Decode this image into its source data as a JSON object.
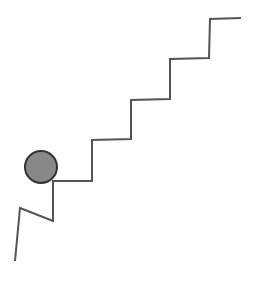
{
  "figure": {
    "width": 260,
    "height": 281,
    "background": "#ffffff"
  },
  "staircase": {
    "stroke": "#555555",
    "stroke_width": 2,
    "points": [
      [
        15,
        261
      ],
      [
        20,
        208
      ],
      [
        53,
        221
      ],
      [
        53,
        181
      ],
      [
        92,
        181
      ],
      [
        92,
        140
      ],
      [
        131,
        139
      ],
      [
        131,
        100
      ],
      [
        170,
        99
      ],
      [
        170,
        59
      ],
      [
        209,
        58
      ],
      [
        210,
        19
      ],
      [
        241,
        18
      ]
    ]
  },
  "ball": {
    "cx": 41,
    "cy": 167,
    "r": 16,
    "fill": "#888888",
    "stroke": "#333333",
    "stroke_width": 2
  }
}
